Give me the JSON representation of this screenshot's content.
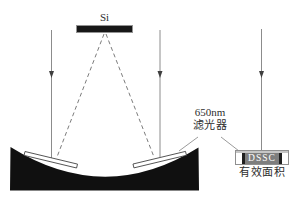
{
  "scene": {
    "si_label": "Si",
    "filter_label_line1": "650nm",
    "filter_label_line2": "滤光器",
    "dssc_label": "DSSC",
    "dssc_caption": "有效面积"
  },
  "colors": {
    "background": "#ffffff",
    "ray_line": "#8c8c8c",
    "arrowhead": "#3f3f3f",
    "dashed_ray": "#7c7c7c",
    "pointer_line": "#9b9b9b",
    "concave_mirror_fill": "#101010",
    "plate_fill": "#ffffff",
    "plate_border": "#3c3c3c",
    "si_bar_fill": "#171717",
    "si_bar_border": "#939393",
    "dssc_middle_fill": "#7e7e7e",
    "dssc_text": "#ffffff",
    "text": "#2e2e2e"
  }
}
